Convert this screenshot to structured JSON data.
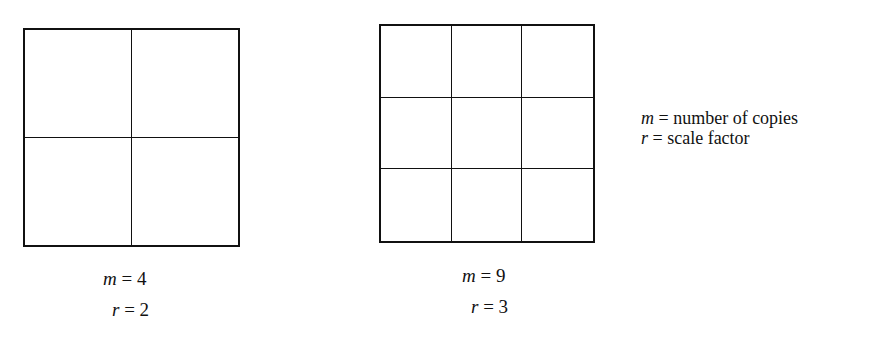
{
  "figures": [
    {
      "name": "grid-2x2",
      "rows": 2,
      "cols": 2,
      "m_var": "m",
      "m_eq": " = 4",
      "r_var": "r",
      "r_eq": " = 2"
    },
    {
      "name": "grid-3x3",
      "rows": 3,
      "cols": 3,
      "m_var": "m",
      "m_eq": " = 9",
      "r_var": "r",
      "r_eq": " = 3"
    }
  ],
  "legend": {
    "m_var": "m",
    "m_text": " = number of copies",
    "r_var": "r",
    "r_text": " = scale factor"
  }
}
